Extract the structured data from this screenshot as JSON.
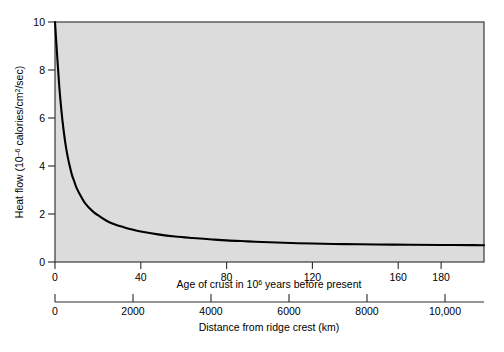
{
  "chart_data": {
    "type": "line",
    "title": "",
    "subtitle": "",
    "ylabel_parts": {
      "pre": "Heat flow (10",
      "sup": "–6",
      "post": " calories/cm",
      "sup2": "2",
      "post2": "/sec)"
    },
    "ylabel": "Heat flow (10–6 calories/cm2/sec)",
    "ylim": [
      0,
      10
    ],
    "yticks": [
      0,
      2,
      4,
      6,
      8,
      10
    ],
    "ytick_labels": [
      "0",
      "2",
      "4",
      "6",
      "8",
      "10"
    ],
    "grid": false,
    "legend": "none",
    "axes": [
      {
        "name": "age-axis",
        "xlabel_parts": {
          "pre": "Age of crust in 10",
          "sup": "6",
          "post": " years before present"
        },
        "xlabel": "Age of crust in 106 years before present",
        "xlim": [
          0,
          200
        ],
        "xticks": [
          0,
          40,
          80,
          120,
          160,
          180
        ],
        "xtick_labels": [
          "0",
          "40",
          "80",
          "120",
          "160",
          "180"
        ]
      },
      {
        "name": "distance-axis",
        "xlabel": "Distance from ridge crest (km)",
        "xlim": [
          0,
          11000
        ],
        "xticks": [
          0,
          2000,
          4000,
          6000,
          8000,
          10000
        ],
        "xtick_labels": [
          "0",
          "2000",
          "4000",
          "6000",
          "8000",
          "10,000"
        ]
      }
    ],
    "series": [
      {
        "name": "heat-flow-decay",
        "color": "#000000",
        "x": [
          0,
          1,
          2,
          3,
          4,
          5,
          6,
          7,
          8,
          9,
          10,
          12,
          14,
          16,
          18,
          20,
          24,
          28,
          32,
          36,
          40,
          48,
          56,
          64,
          72,
          80,
          90,
          100,
          110,
          120,
          135,
          150,
          165,
          180,
          195,
          200
        ],
        "y": [
          10.0,
          8.6,
          7.3,
          6.3,
          5.5,
          4.85,
          4.35,
          3.95,
          3.6,
          3.35,
          3.1,
          2.75,
          2.45,
          2.25,
          2.08,
          1.95,
          1.72,
          1.56,
          1.45,
          1.35,
          1.27,
          1.15,
          1.06,
          1.0,
          0.95,
          0.9,
          0.86,
          0.82,
          0.79,
          0.77,
          0.745,
          0.73,
          0.72,
          0.71,
          0.705,
          0.7
        ]
      }
    ],
    "colors": {
      "plot_background": "#dcdcdc",
      "curve": "#000000",
      "axis": "#2b2b2b",
      "page_background": "#ffffff"
    }
  }
}
